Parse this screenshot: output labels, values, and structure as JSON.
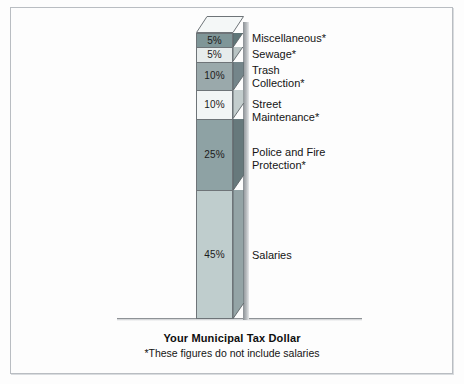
{
  "chart_data": {
    "type": "bar",
    "subtype": "stacked-column-3d",
    "title": "Your Municipal Tax Dollar",
    "footnote": "*These figures do not include salaries",
    "xlabel": "",
    "ylabel": "",
    "units": "percent",
    "total": 100,
    "grid": false,
    "legend_position": "right-inline",
    "categories": [
      "Miscellaneous*",
      "Sewage*",
      "Trash Collection*",
      "Street Maintenance*",
      "Police and Fire Protection*",
      "Salaries"
    ],
    "values": [
      5,
      5,
      10,
      10,
      25,
      45
    ],
    "value_labels": [
      "5%",
      "5%",
      "10%",
      "10%",
      "25%",
      "45%"
    ],
    "segments": [
      {
        "label": "Miscellaneous*",
        "label_lines": "Miscellaneous*",
        "value": 5,
        "value_label": "5%",
        "face": "#7f9698",
        "side": "#5f7678",
        "top": "#e9eeee",
        "label_top": 32
      },
      {
        "label": "Sewage*",
        "label_lines": "Sewage*",
        "value": 5,
        "value_label": "5%",
        "face": "#e7ecec",
        "side": "#b9c4c4",
        "top": "#f5f8f8",
        "label_top": 48
      },
      {
        "label": "Trash Collection*",
        "label_lines": "Trash\nCollection*",
        "value": 10,
        "value_label": "10%",
        "face": "#9aa9ab",
        "side": "#74858a",
        "top": "#ccd6d6",
        "label_top": 64
      },
      {
        "label": "Street Maintenance*",
        "label_lines": "Street\nMaintenance*",
        "value": 10,
        "value_label": "10%",
        "face": "#f2f5f5",
        "side": "#c3cdcd",
        "top": "#fafcfc",
        "label_top": 98
      },
      {
        "label": "Police and Fire Protection*",
        "label_lines": "Police and Fire\nProtection*",
        "value": 25,
        "value_label": "25%",
        "face": "#8ea2a4",
        "side": "#67797c",
        "top": "#c0cccc",
        "label_top": 146
      },
      {
        "label": "Salaries",
        "label_lines": "Salaries",
        "value": 45,
        "value_label": "45%",
        "face": "#bfcdcd",
        "side": "#94a4a6",
        "top": "#dde5e5",
        "label_top": 249
      }
    ]
  },
  "caption": {
    "title": "Your Municipal Tax Dollar",
    "note": "*These figures do not include salaries"
  },
  "colors": {
    "frame_border": "#b9bdc2",
    "background": "#fdfdfd",
    "ground_line": "#8e9296",
    "outline": "#6e7478",
    "text": "#141414"
  }
}
